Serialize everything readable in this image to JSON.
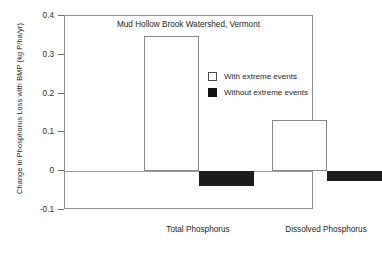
{
  "chart_data": {
    "type": "bar",
    "title": "Mud Hollow Brook Watershed, Vermont",
    "xlabel": "",
    "ylabel": "Change in Phosphorus Loss with BMP (kg P/ha/yr)",
    "categories": [
      "Total Phosphorus",
      "Dissolved Phosphorus"
    ],
    "series": [
      {
        "name": "With extreme events",
        "style": "open",
        "color": "#ffffff",
        "edge_color": "#8a8a8a",
        "values": [
          0.348,
          0.131
        ]
      },
      {
        "name": "Without extreme events",
        "style": "filled",
        "color": "#1c1c1c",
        "edge_color": "#1c1c1c",
        "values": [
          -0.039,
          -0.026
        ]
      }
    ],
    "ylim": [
      -0.1,
      0.4
    ],
    "ytick_values": [
      0.4,
      0.3,
      0.2,
      0.1,
      0,
      -0.1
    ],
    "ytick_labels": [
      "0.4",
      "0.3",
      "0.2",
      "0.1",
      "0",
      "-0.1"
    ],
    "grid": false,
    "zero_line": true,
    "legend_position": "upper right"
  },
  "legend": {
    "entries": [
      {
        "label": "With extreme events",
        "swatch": "open-square-icon"
      },
      {
        "label": "Without extreme events",
        "swatch": "filled-square-icon"
      }
    ]
  }
}
